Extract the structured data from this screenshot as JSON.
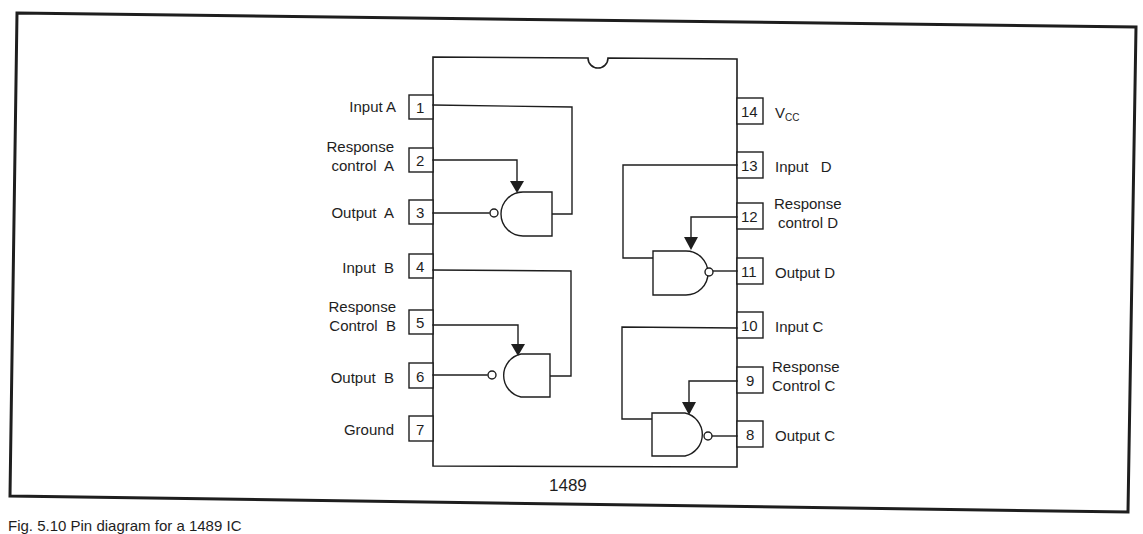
{
  "figure": {
    "chip_label": "1489",
    "caption": "Fig. 5.10 Pin diagram for a 1489 IC",
    "colors": {
      "line": "#1e1e1e",
      "background": "#ffffff"
    }
  },
  "pins_left": [
    {
      "number": "1",
      "label_line1": "Input A",
      "label_line2": ""
    },
    {
      "number": "2",
      "label_line1": "Response",
      "label_line2": "control  A"
    },
    {
      "number": "3",
      "label_line1": "Output  A",
      "label_line2": ""
    },
    {
      "number": "4",
      "label_line1": "Input  B",
      "label_line2": ""
    },
    {
      "number": "5",
      "label_line1": "Response",
      "label_line2": "Control  B"
    },
    {
      "number": "6",
      "label_line1": "Output  B",
      "label_line2": ""
    },
    {
      "number": "7",
      "label_line1": "Ground",
      "label_line2": ""
    }
  ],
  "pins_right": [
    {
      "number": "14",
      "label_main": "V",
      "label_sub": "CC",
      "label_line2": ""
    },
    {
      "number": "13",
      "label_main": "Input   D",
      "label_sub": "",
      "label_line2": ""
    },
    {
      "number": "12",
      "label_main": "Response",
      "label_sub": "",
      "label_line2": "control D"
    },
    {
      "number": "11",
      "label_main": "Output D",
      "label_sub": "",
      "label_line2": ""
    },
    {
      "number": "10",
      "label_main": "Input C",
      "label_sub": "",
      "label_line2": ""
    },
    {
      "number": "9",
      "label_main": "Response",
      "label_sub": "",
      "label_line2": "Control C"
    },
    {
      "number": "8",
      "label_main": "Output C",
      "label_sub": "",
      "label_line2": ""
    }
  ],
  "gates": [
    {
      "name": "Receiver A",
      "type": "inverting-receiver",
      "input_pin": "1",
      "control_pin": "2",
      "output_pin": "3"
    },
    {
      "name": "Receiver B",
      "type": "inverting-receiver",
      "input_pin": "4",
      "control_pin": "5",
      "output_pin": "6"
    },
    {
      "name": "Receiver D",
      "type": "inverting-receiver",
      "input_pin": "13",
      "control_pin": "12",
      "output_pin": "11"
    },
    {
      "name": "Receiver C",
      "type": "inverting-receiver",
      "input_pin": "10",
      "control_pin": "9",
      "output_pin": "8"
    }
  ]
}
